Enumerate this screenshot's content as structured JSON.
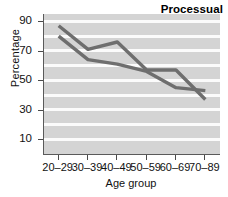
{
  "chart_data": {
    "type": "line",
    "title": "Processual",
    "xlabel": "Age group",
    "ylabel": "Percentage",
    "categories": [
      "20–29",
      "30–39",
      "40–49",
      "50–59",
      "60–69",
      "70–89"
    ],
    "series": [
      {
        "name": "upper",
        "values": [
          87,
          71,
          76,
          57,
          57,
          37
        ],
        "color": "#6e6e6e"
      },
      {
        "name": "lower",
        "values": [
          80,
          64,
          61,
          56,
          45,
          43
        ],
        "color": "#6e6e6e"
      }
    ],
    "ylim": [
      0,
      95
    ],
    "yticks": [
      90,
      70,
      50,
      30,
      10
    ],
    "ytick_labels": [
      "90",
      "70",
      "50",
      "30",
      "10"
    ],
    "gridlines": [
      90,
      80,
      70,
      60,
      50,
      40,
      30,
      20,
      10
    ],
    "grid": true,
    "grid_color": "#fbfbfb",
    "plot_background": "#d4d4d4",
    "legend": "none",
    "legend_position": "none"
  },
  "axes": {
    "y_title": "Percentage",
    "x_title": "Age group",
    "y_labels": [
      "90",
      "70",
      "50",
      "30",
      "10"
    ],
    "x_labels": [
      "20–29",
      "30–39",
      "40–49",
      "50–59",
      "60–69",
      "70–89"
    ]
  },
  "title_box": {
    "label": "Processual"
  },
  "colors": {
    "line": "#6e6e6e",
    "plot_bg": "#d4d4d4",
    "grid": "#fbfbfb",
    "axis": "#5a5a5a",
    "text": "#111111"
  }
}
